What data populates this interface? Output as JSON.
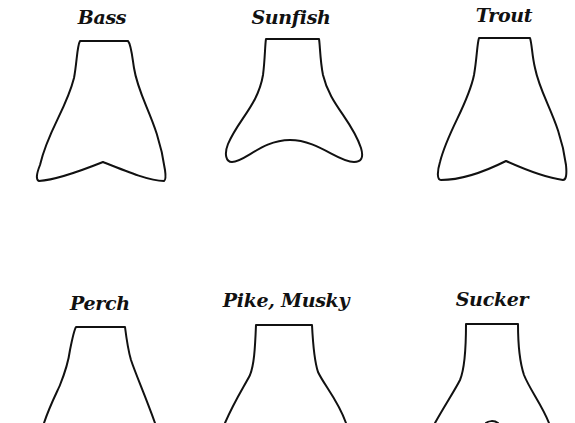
{
  "diagram": {
    "title": "",
    "tails": [
      {
        "id": "bass",
        "label": "Bass",
        "row": 1,
        "col": 1,
        "shape": "forked-notch"
      },
      {
        "id": "sunfish",
        "label": "Sunfish",
        "row": 1,
        "col": 2,
        "shape": "rounded-concave"
      },
      {
        "id": "trout",
        "label": "Trout",
        "row": 1,
        "col": 3,
        "shape": "forked-notch"
      },
      {
        "id": "perch",
        "label": "Perch",
        "row": 2,
        "col": 1,
        "shape": "partial"
      },
      {
        "id": "pike-musky",
        "label": "Pike, Musky",
        "row": 2,
        "col": 2,
        "shape": "partial"
      },
      {
        "id": "sucker",
        "label": "Sucker",
        "row": 2,
        "col": 3,
        "shape": "partial"
      }
    ]
  }
}
